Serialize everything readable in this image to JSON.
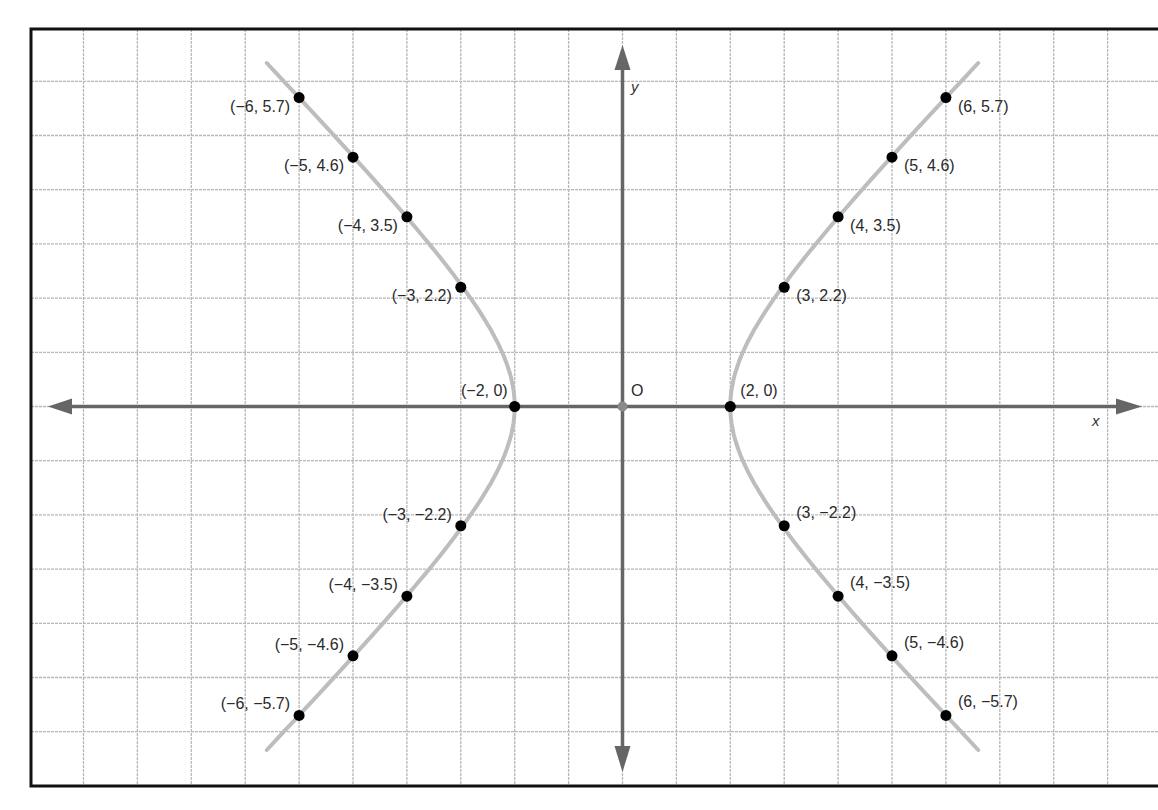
{
  "chart_data": {
    "type": "scatter",
    "title": "",
    "xlabel": "x",
    "ylabel": "y",
    "origin_label": "O",
    "grid": true,
    "grid_step": 1,
    "xlim": [
      -11,
      9.7
    ],
    "ylim": [
      -7,
      7
    ],
    "curve": {
      "name": "hyperbola",
      "vertices": [
        [
          -2,
          0
        ],
        [
          2,
          0
        ]
      ],
      "color": "#bdbdbd"
    },
    "points": [
      {
        "x": -6,
        "y": 5.7,
        "label": "(−6, 5.7)"
      },
      {
        "x": -5,
        "y": 4.6,
        "label": "(−5, 4.6)"
      },
      {
        "x": -4,
        "y": 3.5,
        "label": "(−4, 3.5)"
      },
      {
        "x": -3,
        "y": 2.2,
        "label": "(−3, 2.2)"
      },
      {
        "x": -2,
        "y": 0,
        "label": "(−2, 0)"
      },
      {
        "x": -3,
        "y": -2.2,
        "label": "(−3, −2.2)"
      },
      {
        "x": -4,
        "y": -3.5,
        "label": "(−4, −3.5)"
      },
      {
        "x": -5,
        "y": -4.6,
        "label": "(−5, −4.6)"
      },
      {
        "x": -6,
        "y": -5.7,
        "label": "(−6, −5.7)"
      },
      {
        "x": 6,
        "y": 5.7,
        "label": "(6, 5.7)"
      },
      {
        "x": 5,
        "y": 4.6,
        "label": "(5, 4.6)"
      },
      {
        "x": 4,
        "y": 3.5,
        "label": "(4, 3.5)"
      },
      {
        "x": 3,
        "y": 2.2,
        "label": "(3, 2.2)"
      },
      {
        "x": 2,
        "y": 0,
        "label": "(2, 0)"
      },
      {
        "x": 3,
        "y": -2.2,
        "label": "(3, −2.2)"
      },
      {
        "x": 4,
        "y": -3.5,
        "label": "(4, −3.5)"
      },
      {
        "x": 5,
        "y": -4.6,
        "label": "(5, −4.6)"
      },
      {
        "x": 6,
        "y": -5.7,
        "label": "(6, −5.7)"
      }
    ],
    "colors": {
      "grid": "#b8b8b8",
      "axis": "#666666",
      "frame": "#111111",
      "point": "#000000",
      "curve": "#bdbdbd"
    }
  }
}
